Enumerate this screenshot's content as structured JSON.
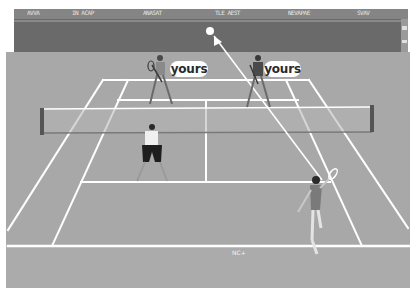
{
  "game": {
    "title": "3D tennis doubles match",
    "scene": "doubles-court-rear-view",
    "palette": {
      "sky": "#ffffff",
      "stands": "#8a8a8a",
      "backwall": "#6c6c6c",
      "court": "#a9a9a9",
      "lines": "#ffffff",
      "net_post": "#555555",
      "ball": "#ffffff"
    }
  },
  "opponents": [
    {
      "id": "far-left-player",
      "label": "yours"
    },
    {
      "id": "far-right-player",
      "label": "yours"
    }
  ],
  "teammates": [
    {
      "id": "near-net-player",
      "label": ""
    },
    {
      "id": "server-player",
      "label": ""
    }
  ],
  "ball": {
    "state": "in-flight",
    "direction_indicator": "arrow"
  },
  "stands": {
    "banners": [
      "AVVA",
      "IN ACAP",
      "ANASAT",
      "TLE AEST",
      "NEVAPAE",
      "SVAV"
    ]
  },
  "hud": {
    "bottom_text": "NC+"
  }
}
